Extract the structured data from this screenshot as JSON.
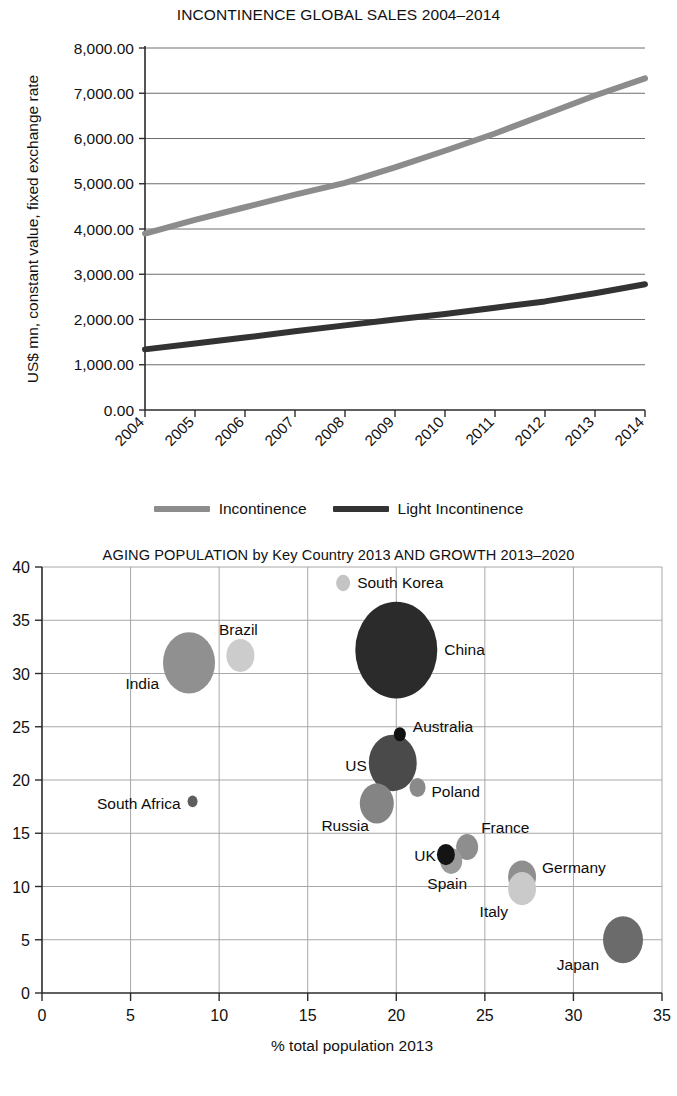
{
  "figures": {
    "line": {
      "title": "INCONTINENCE GLOBAL SALES 2004–2014",
      "ylabel": "US$  mn, constant value, fixed exchange rate",
      "legend": [
        {
          "label": "Incontinence",
          "color": "#8c8c8c"
        },
        {
          "label": "Light Incontinence",
          "color": "#333333"
        }
      ]
    },
    "bubble": {
      "title": "AGING POPULATION  by Key Country 2013 AND GROWTH 2013–2020",
      "xlabel": "% total population 2013"
    }
  },
  "chart_data": [
    {
      "type": "line",
      "title": "INCONTINENCE GLOBAL SALES 2004–2014",
      "xlabel": "",
      "ylabel": "US$  mn, constant value, fixed exchange rate",
      "categories": [
        "2004",
        "2005",
        "2006",
        "2007",
        "2008",
        "2009",
        "2010",
        "2011",
        "2012",
        "2013",
        "2014"
      ],
      "ylim": [
        0,
        8000
      ],
      "yticks": [
        "0.00",
        "1,000.00",
        "2,000.00",
        "3,000.00",
        "4,000.00",
        "5,000.00",
        "6,000.00",
        "7,000.00",
        "8,000.00"
      ],
      "ytick_values": [
        0,
        1000,
        2000,
        3000,
        4000,
        5000,
        6000,
        7000,
        8000
      ],
      "grid": true,
      "legend_position": "bottom",
      "series": [
        {
          "name": "Incontinence",
          "color": "#8c8c8c",
          "values": [
            3900,
            4200,
            4480,
            4760,
            5020,
            5360,
            5730,
            6110,
            6530,
            6950,
            7330
          ]
        },
        {
          "name": "Light Incontinence",
          "color": "#333333",
          "values": [
            1340,
            1470,
            1600,
            1740,
            1870,
            2000,
            2120,
            2260,
            2400,
            2580,
            2780
          ]
        }
      ]
    },
    {
      "type": "scatter",
      "subtype": "bubble",
      "title": "AGING POPULATION  by Key Country 2013 AND GROWTH 2013–2020",
      "xlabel": "% total population 2013",
      "ylabel": "",
      "xlim": [
        0,
        35
      ],
      "ylim": [
        0,
        40
      ],
      "xticks": [
        0,
        5,
        10,
        15,
        20,
        25,
        30,
        35
      ],
      "yticks": [
        0,
        5,
        10,
        15,
        20,
        25,
        30,
        35,
        40
      ],
      "grid": true,
      "legend_position": "none",
      "points": [
        {
          "name": "South Korea",
          "x": 17.0,
          "y": 38.5,
          "r": 7,
          "color": "#c4c4c4",
          "label_dx": 14,
          "label_dy": 5,
          "anchor": "start"
        },
        {
          "name": "China",
          "x": 20.0,
          "y": 32.2,
          "r": 41,
          "color": "#2b2b2b",
          "label_dx": 48,
          "label_dy": 5,
          "anchor": "start"
        },
        {
          "name": "Brazil",
          "x": 11.2,
          "y": 31.7,
          "r": 14,
          "color": "#cccccc",
          "label_dx": -2,
          "label_dy": -20,
          "anchor": "middle"
        },
        {
          "name": "India",
          "x": 8.3,
          "y": 31.0,
          "r": 26,
          "color": "#909090",
          "label_dx": -30,
          "label_dy": 26,
          "anchor": "end"
        },
        {
          "name": "Australia",
          "x": 20.2,
          "y": 24.3,
          "r": 6,
          "color": "#111111",
          "label_dx": 13,
          "label_dy": -2,
          "anchor": "start"
        },
        {
          "name": "US",
          "x": 19.8,
          "y": 21.6,
          "r": 24,
          "color": "#4a4a4a",
          "label_dx": -26,
          "label_dy": 8,
          "anchor": "end"
        },
        {
          "name": "Poland",
          "x": 21.2,
          "y": 19.3,
          "r": 8,
          "color": "#8a8a8a",
          "label_dx": 14,
          "label_dy": 10,
          "anchor": "start"
        },
        {
          "name": "South Africa",
          "x": 8.5,
          "y": 18.0,
          "r": 5,
          "color": "#5e5e5e",
          "label_dx": -12,
          "label_dy": 8,
          "anchor": "end"
        },
        {
          "name": "Russia",
          "x": 18.9,
          "y": 17.8,
          "r": 17,
          "color": "#848484",
          "label_dx": -8,
          "label_dy": 28,
          "anchor": "end"
        },
        {
          "name": "France",
          "x": 24.0,
          "y": 13.7,
          "r": 11,
          "color": "#8e8e8e",
          "label_dx": 14,
          "label_dy": -14,
          "anchor": "start"
        },
        {
          "name": "UK",
          "x": 22.8,
          "y": 13.0,
          "r": 9,
          "color": "#141414",
          "label_dx": -10,
          "label_dy": 6,
          "anchor": "end"
        },
        {
          "name": "Spain",
          "x": 23.1,
          "y": 12.4,
          "r": 11,
          "color": "#9b9b9b",
          "label_dx": -4,
          "label_dy": 28,
          "anchor": "middle"
        },
        {
          "name": "Germany",
          "x": 27.1,
          "y": 10.9,
          "r": 14,
          "color": "#8f8f8f",
          "label_dx": 20,
          "label_dy": -4,
          "anchor": "start"
        },
        {
          "name": "Italy",
          "x": 27.1,
          "y": 9.8,
          "r": 14,
          "color": "#cacaca",
          "label_dx": -14,
          "label_dy": 28,
          "anchor": "end"
        },
        {
          "name": "Japan",
          "x": 32.8,
          "y": 5.0,
          "r": 20,
          "color": "#6b6b6b",
          "label_dx": -24,
          "label_dy": 30,
          "anchor": "end"
        }
      ]
    }
  ]
}
